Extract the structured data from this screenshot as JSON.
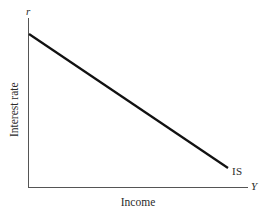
{
  "figure": {
    "width": 269,
    "height": 216,
    "background": "#ffffff"
  },
  "axes": {
    "vertical": {
      "tip_label": "r",
      "title": "Interest rate",
      "color": "#555555",
      "x": 28,
      "y_top": 18,
      "y_bottom": 187
    },
    "horizontal": {
      "tip_label": "Y",
      "title": "Income",
      "color": "#555555",
      "y": 187,
      "x_left": 28,
      "x_right": 248
    }
  },
  "curve": {
    "label": "IS",
    "color": "#111111",
    "width": 2.2,
    "x1": 29,
    "y1": 34,
    "x2": 228,
    "y2": 168
  },
  "chart_data": {
    "type": "line",
    "title": "",
    "subtitle": "",
    "xlabel": "Income",
    "ylabel": "Interest rate",
    "x_axis_symbol": "Y",
    "y_axis_symbol": "r",
    "xlim": [
      0,
      1
    ],
    "ylim": [
      0,
      1
    ],
    "grid": false,
    "legend": "none",
    "annotations": [
      {
        "text": "IS",
        "x": 0.92,
        "y": 0.12,
        "description": "Label at lower-right end of the downward sloping IS schedule"
      }
    ],
    "series": [
      {
        "name": "IS",
        "description": "Downward sloping IS curve: combinations of interest rate and income at which the goods market is in equilibrium",
        "x": [
          0.0,
          1.0
        ],
        "y": [
          0.905,
          0.112
        ],
        "slope": -0.793
      }
    ],
    "xticks": [],
    "yticks": [],
    "xticklabels": [],
    "yticklabels": []
  }
}
